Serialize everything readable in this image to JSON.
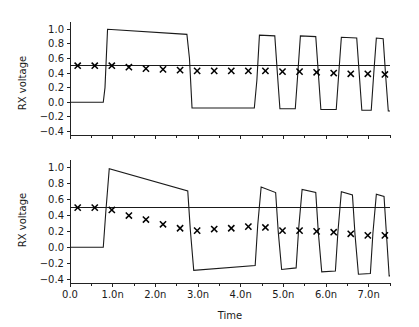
{
  "figure": {
    "title": "",
    "background_color": "#ffffff",
    "line_color": "#1a1a1a",
    "marker_color": "#000000",
    "width": 419,
    "height": 327
  },
  "chart_data": [
    {
      "id": "top-panel",
      "type": "line",
      "title": "",
      "xlabel": "",
      "ylabel": "RX voltage",
      "xlim": [
        0.0,
        7.5
      ],
      "ylim": [
        -0.45,
        1.1
      ],
      "grid": false,
      "legend": null,
      "y_ticks": [
        -0.4,
        -0.2,
        0.0,
        0.2,
        0.4,
        0.6,
        0.8,
        1.0
      ],
      "y_tick_labels": [
        "-0.4",
        "-0.2",
        "0.0",
        "0.2",
        "0.4",
        "0.6",
        "0.8",
        "1.0"
      ],
      "x_ticks": [
        0.0,
        1.0,
        2.0,
        3.0,
        4.0,
        5.0,
        6.0,
        7.0
      ],
      "x_tick_labels": [
        "",
        "",
        "",
        "",
        "",
        "",
        "",
        ""
      ],
      "x_minor_tick_step": 0.5,
      "threshold": {
        "name": "decision-threshold",
        "value": 0.5
      },
      "series": [
        {
          "name": "rx-waveform-top",
          "style": "step-with-droop",
          "points": [
            [
              0.0,
              0.0
            ],
            [
              0.78,
              0.0
            ],
            [
              0.82,
              0.2
            ],
            [
              0.88,
              1.0
            ],
            [
              2.74,
              0.93
            ],
            [
              2.8,
              0.6
            ],
            [
              2.86,
              -0.08
            ],
            [
              4.32,
              -0.08
            ],
            [
              4.38,
              0.3
            ],
            [
              4.44,
              0.92
            ],
            [
              4.8,
              0.91
            ],
            [
              4.86,
              0.4
            ],
            [
              4.92,
              -0.09
            ],
            [
              5.28,
              -0.09
            ],
            [
              5.34,
              0.4
            ],
            [
              5.4,
              0.91
            ],
            [
              5.76,
              0.9
            ],
            [
              5.82,
              0.4
            ],
            [
              5.88,
              -0.1
            ],
            [
              6.24,
              -0.1
            ],
            [
              6.3,
              0.4
            ],
            [
              6.36,
              0.89
            ],
            [
              6.72,
              0.88
            ],
            [
              6.78,
              0.38
            ],
            [
              6.84,
              -0.11
            ],
            [
              7.06,
              -0.11
            ],
            [
              7.12,
              0.4
            ],
            [
              7.18,
              0.88
            ],
            [
              7.34,
              0.87
            ],
            [
              7.4,
              0.35
            ],
            [
              7.46,
              -0.12
            ],
            [
              7.5,
              -0.12
            ]
          ]
        }
      ],
      "markers": {
        "name": "sample-markers-top",
        "symbol": "x",
        "x": [
          0.18,
          0.58,
          0.98,
          1.38,
          1.78,
          2.18,
          2.58,
          2.98,
          3.38,
          3.78,
          4.18,
          4.58,
          4.98,
          5.38,
          5.78,
          6.18,
          6.58,
          6.98,
          7.38
        ],
        "y": [
          0.5,
          0.5,
          0.5,
          0.48,
          0.46,
          0.45,
          0.44,
          0.43,
          0.43,
          0.43,
          0.43,
          0.43,
          0.42,
          0.42,
          0.41,
          0.4,
          0.39,
          0.39,
          0.38
        ]
      }
    },
    {
      "id": "bottom-panel",
      "type": "line",
      "title": "",
      "xlabel": "Time",
      "ylabel": "RX voltage",
      "xlim": [
        0.0,
        7.5
      ],
      "ylim": [
        -0.45,
        1.1
      ],
      "grid": false,
      "legend": null,
      "y_ticks": [
        -0.4,
        -0.2,
        0.0,
        0.2,
        0.4,
        0.6,
        0.8,
        1.0
      ],
      "y_tick_labels": [
        "-0.4",
        "-0.2",
        "0.0",
        "0.2",
        "0.4",
        "0.6",
        "0.8",
        "1.0"
      ],
      "x_ticks": [
        0.0,
        1.0,
        2.0,
        3.0,
        4.0,
        5.0,
        6.0,
        7.0
      ],
      "x_tick_labels": [
        "0.0",
        "1.0n",
        "2.0n",
        "3.0n",
        "4.0n",
        "5.0n",
        "6.0n",
        "7.0n"
      ],
      "x_minor_tick_step": 0.5,
      "threshold": {
        "name": "decision-threshold",
        "value": 0.5
      },
      "series": [
        {
          "name": "rx-waveform-bottom",
          "style": "step-with-droop",
          "points": [
            [
              0.0,
              0.0
            ],
            [
              0.78,
              0.0
            ],
            [
              0.84,
              0.45
            ],
            [
              0.92,
              0.99
            ],
            [
              2.76,
              0.71
            ],
            [
              2.82,
              0.22
            ],
            [
              2.9,
              -0.29
            ],
            [
              4.34,
              -0.23
            ],
            [
              4.4,
              0.28
            ],
            [
              4.48,
              0.76
            ],
            [
              4.82,
              0.69
            ],
            [
              4.88,
              0.2
            ],
            [
              4.96,
              -0.28
            ],
            [
              5.3,
              -0.26
            ],
            [
              5.36,
              0.24
            ],
            [
              5.44,
              0.73
            ],
            [
              5.76,
              0.69
            ],
            [
              5.82,
              0.19
            ],
            [
              5.9,
              -0.31
            ],
            [
              6.22,
              -0.3
            ],
            [
              6.28,
              0.2
            ],
            [
              6.36,
              0.7
            ],
            [
              6.62,
              0.66
            ],
            [
              6.68,
              0.16
            ],
            [
              6.76,
              -0.34
            ],
            [
              7.04,
              -0.33
            ],
            [
              7.1,
              0.18
            ],
            [
              7.18,
              0.67
            ],
            [
              7.36,
              0.64
            ],
            [
              7.42,
              0.14
            ],
            [
              7.48,
              -0.36
            ],
            [
              7.5,
              -0.36
            ]
          ]
        }
      ],
      "markers": {
        "name": "sample-markers-bottom",
        "symbol": "x",
        "x": [
          0.18,
          0.58,
          0.98,
          1.38,
          1.78,
          2.18,
          2.58,
          2.98,
          3.38,
          3.78,
          4.18,
          4.58,
          4.98,
          5.38,
          5.78,
          6.18,
          6.58,
          6.98,
          7.38
        ],
        "y": [
          0.5,
          0.5,
          0.47,
          0.4,
          0.35,
          0.29,
          0.24,
          0.21,
          0.23,
          0.24,
          0.26,
          0.25,
          0.21,
          0.21,
          0.2,
          0.19,
          0.17,
          0.15,
          0.15
        ]
      }
    }
  ]
}
